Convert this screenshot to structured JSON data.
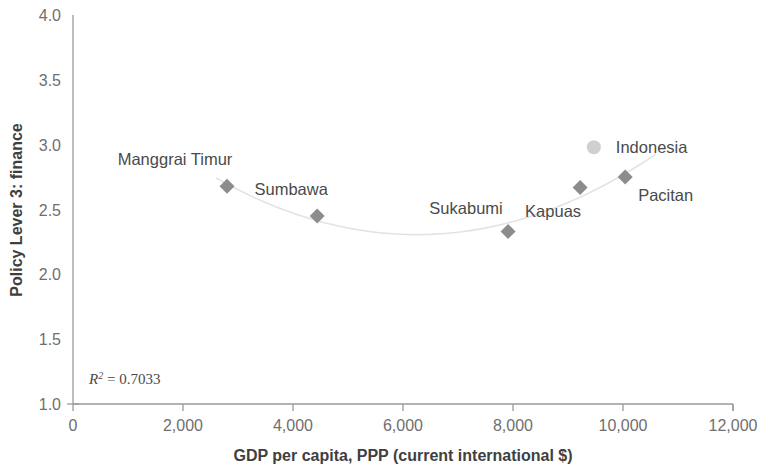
{
  "chart_data": {
    "type": "scatter",
    "title": "",
    "xlabel": "GDP per capita, PPP (current international $)",
    "ylabel": "Policy Lever 3: finance",
    "xlim": [
      0,
      12000
    ],
    "ylim": [
      1.0,
      4.0
    ],
    "grid": false,
    "legend": "none",
    "x_ticks": [
      "0",
      "2,000",
      "4,000",
      "6,000",
      "8,000",
      "10,000",
      "12,000"
    ],
    "x_tick_values": [
      0,
      2000,
      4000,
      6000,
      8000,
      10000,
      12000
    ],
    "y_ticks": [
      "1.0",
      "1.5",
      "2.0",
      "2.5",
      "3.0",
      "3.5",
      "4.0"
    ],
    "y_tick_values": [
      1.0,
      1.5,
      2.0,
      2.5,
      3.0,
      3.5,
      4.0
    ],
    "annotation": "R2 = 0.7033",
    "r_squared": 0.7033,
    "points": [
      {
        "label": "Manggrai Timur",
        "x": 2800,
        "y": 2.68,
        "marker": "diamond",
        "label_dx": -52,
        "label_dy": -21
      },
      {
        "label": "Sumbawa",
        "x": 4440,
        "y": 2.45,
        "marker": "diamond",
        "label_dx": -26,
        "label_dy": -21
      },
      {
        "label": "Sukabumi",
        "x": 7910,
        "y": 2.33,
        "marker": "diamond",
        "label_dx": -42,
        "label_dy": -18
      },
      {
        "label": "Kapuas",
        "x": 9220,
        "y": 2.67,
        "marker": "diamond",
        "label_dx": -27,
        "label_dy": 30
      },
      {
        "label": "Pacitan",
        "x": 10040,
        "y": 2.75,
        "marker": "diamond",
        "label_dx": 13,
        "label_dy": 24
      },
      {
        "label": "Indonesia",
        "x": 9470,
        "y": 2.98,
        "marker": "country",
        "label_dx": 22,
        "label_dy": 6
      }
    ],
    "trendline": {
      "type": "quadratic",
      "stroke_color": "#e3e3e3",
      "x_start": 2600,
      "x_end": 10600,
      "coefficients_note": "U-shaped fit through district points"
    },
    "colors": {
      "marker": "#8c8c8c",
      "country_marker": "#cfcfcf",
      "axis": "#9a9a9a",
      "tick_text": "#6f6f6f",
      "label_text": "#4a4a4a",
      "title_text": "#3f3f3f",
      "background": "#ffffff"
    }
  }
}
